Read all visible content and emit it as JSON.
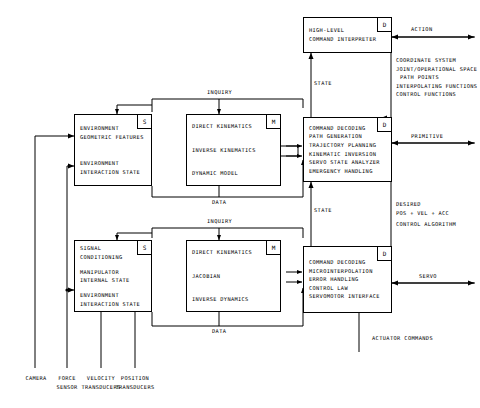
{
  "diagram": {
    "boxes": {
      "high_level": {
        "badge": "D",
        "lines": [
          "HIGH-LEVEL",
          "COMMAND INTERPRETER"
        ]
      },
      "env_geometric": {
        "badge": "S",
        "group_a": [
          "ENVIRONMENT",
          "GEOMETRIC FEATURES"
        ],
        "group_b": [
          "ENVIRONMENT",
          "INTERACTION STATE"
        ]
      },
      "model_upper": {
        "badge": "M",
        "lines": [
          "DIRECT KINEMATICS",
          "INVERSE KINEMATICS",
          "DYNAMIC MODEL"
        ]
      },
      "primitive_level": {
        "badge": "D",
        "lines": [
          "COMMAND DECODING",
          "PATH GENERATION",
          "TRAJECTORY PLANNING",
          "KINEMATIC INVERSION",
          "SERVO STATE ANALYZER",
          "EMERGENCY HANDLING"
        ]
      },
      "signal_cond": {
        "badge": "S",
        "group_a": [
          "SIGNAL",
          "CONDITIONING"
        ],
        "group_b": [
          "MANIPULATOR",
          "INTERNAL STATE"
        ],
        "group_c": [
          "ENVIRONMENT",
          "INTERACTION STATE"
        ]
      },
      "model_lower": {
        "badge": "M",
        "lines": [
          "DIRECT KINEMATICS",
          "JACOBIAN",
          "INVERSE DYNAMICS"
        ]
      },
      "servo_level": {
        "badge": "D",
        "lines": [
          "COMMAND DECODING",
          "MICROINTERPOLATION",
          "ERROR HANDLING",
          "CONTROL LAW",
          "SERVOMOTOR INTERFACE"
        ]
      }
    },
    "flow_labels": {
      "action": "ACTION",
      "primitive": "PRIMITIVE",
      "servo": "SERVO",
      "state_top": "STATE",
      "state_mid": "STATE",
      "inquiry_upper": "INQUIRY",
      "inquiry_lower": "INQUIRY",
      "data_upper": "DATA",
      "data_lower": "DATA",
      "actuator_commands": "ACTUATOR COMMANDS"
    },
    "annotations": {
      "high_level_out": [
        "COORDINATE SYSTEM",
        "JOINT/OPERATIONAL SPACE",
        "PATH POINTS",
        "INTERPOLATING FUNCTIONS",
        "CONTROL FUNCTIONS"
      ],
      "primitive_out": [
        "DESIRED",
        "POS + VEL + ACC",
        "CONTROL ALGORITHM"
      ]
    },
    "sensors": [
      {
        "line1": "CAMERA",
        "line2": ""
      },
      {
        "line1": "FORCE",
        "line2": "SENSOR"
      },
      {
        "line1": "VELOCITY",
        "line2": "TRANSDUCERS"
      },
      {
        "line1": "POSITION",
        "line2": "TRANSDUCERS"
      }
    ],
    "colors": {
      "stroke": "#000000",
      "background": "#ffffff"
    }
  }
}
